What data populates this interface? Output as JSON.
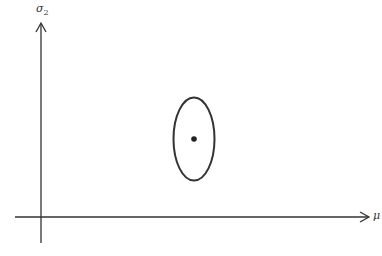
{
  "diagram": {
    "y_axis": {
      "label": "σ",
      "subscript": "2"
    },
    "x_axis": {
      "label": "μ"
    },
    "ellipse": {
      "cx": 194,
      "cy": 139,
      "rx": 20.5,
      "ry": 41.5
    },
    "center_point": {
      "cx": 194,
      "cy": 139,
      "r": 2.8
    },
    "colors": {
      "stroke": "#333333",
      "background": "#ffffff"
    }
  }
}
